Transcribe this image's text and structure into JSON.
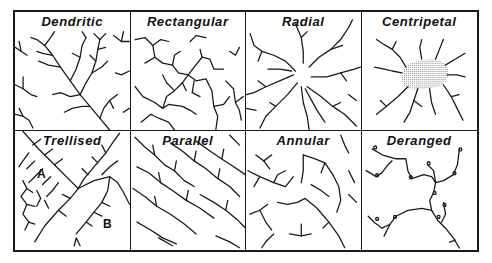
{
  "figure": {
    "panels": [
      {
        "id": "dendritic",
        "title": "Dendritic"
      },
      {
        "id": "rectangular",
        "title": "Rectangular"
      },
      {
        "id": "radial",
        "title": "Radial"
      },
      {
        "id": "centripetal",
        "title": "Centripetal"
      },
      {
        "id": "trellised",
        "title": "Trellised",
        "markers": [
          "A",
          "B"
        ]
      },
      {
        "id": "parallel",
        "title": "Parallel"
      },
      {
        "id": "annular",
        "title": "Annular"
      },
      {
        "id": "deranged",
        "title": "Deranged"
      }
    ]
  },
  "colors": {
    "line": "#1a1a1a",
    "background": "#ffffff",
    "stipple": "#9a9a9a"
  }
}
